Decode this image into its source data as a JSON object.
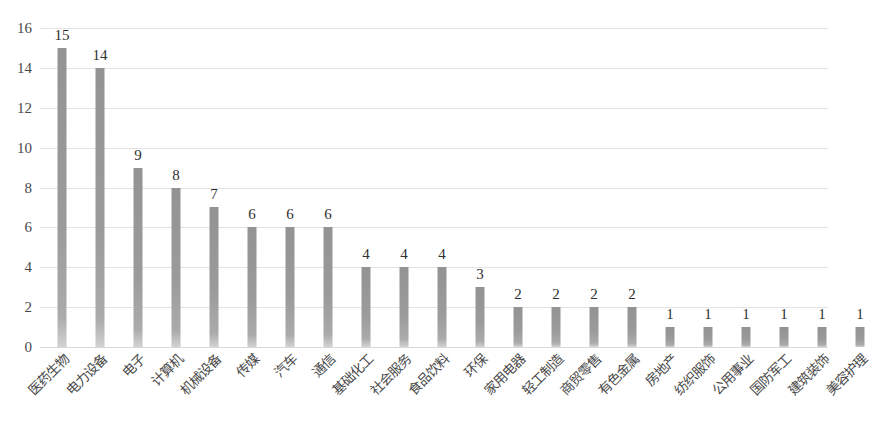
{
  "chart_data": {
    "type": "bar",
    "title": "",
    "subtitle": "",
    "xlabel": "",
    "ylabel": "",
    "ylim": [
      0,
      16
    ],
    "yticks": [
      0,
      2,
      4,
      6,
      8,
      10,
      12,
      14,
      16
    ],
    "grid": true,
    "legend": null,
    "orientation": "vertical",
    "bar_color": "#9a9a9a",
    "gridline_color": "#e3e3e3",
    "categories": [
      "医药生物",
      "电力设备",
      "电子",
      "计算机",
      "机械设备",
      "传媒",
      "汽车",
      "通信",
      "基础化工",
      "社会服务",
      "食品饮料",
      "环保",
      "家用电器",
      "轻工制造",
      "商贸零售",
      "有色金属",
      "房地产",
      "纺织服饰",
      "公用事业",
      "国防军工",
      "建筑装饰",
      "美容护理"
    ],
    "values": [
      15,
      14,
      9,
      8,
      7,
      6,
      6,
      6,
      4,
      4,
      4,
      3,
      2,
      2,
      2,
      2,
      1,
      1,
      1,
      1,
      1,
      1
    ],
    "value_labels": [
      "15",
      "14",
      "9",
      "8",
      "7",
      "6",
      "6",
      "6",
      "4",
      "4",
      "4",
      "3",
      "2",
      "2",
      "2",
      "2",
      "1",
      "1",
      "1",
      "1",
      "1",
      "1"
    ],
    "ytick_labels": [
      "0",
      "2",
      "4",
      "6",
      "8",
      "10",
      "12",
      "14",
      "16"
    ]
  }
}
